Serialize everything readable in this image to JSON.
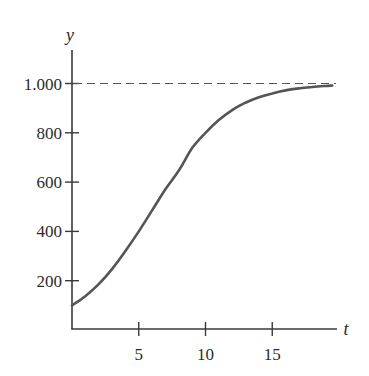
{
  "chart_data": {
    "type": "line",
    "title": "",
    "xlabel": "t",
    "ylabel": "y",
    "xlim": [
      0,
      20
    ],
    "ylim": [
      0,
      1000
    ],
    "x_ticks": [
      5,
      10,
      15
    ],
    "x_tick_labels": [
      "5",
      "10",
      "15"
    ],
    "y_ticks": [
      200,
      400,
      600,
      800,
      1000
    ],
    "y_tick_labels": [
      "200",
      "400",
      "600",
      "800",
      "1.000"
    ],
    "grid": false,
    "legend": null,
    "asymptote": {
      "y": 1000,
      "style": "dashed"
    },
    "series": [
      {
        "name": "logistic curve",
        "x": [
          0,
          1,
          2,
          3,
          4,
          5,
          6,
          7,
          8,
          9,
          10,
          11,
          12,
          13,
          14,
          15,
          16,
          17,
          18,
          19,
          19.5
        ],
        "values": [
          100,
          137,
          186,
          247,
          320,
          400,
          485,
          571,
          647,
          738,
          800,
          852,
          892,
          922,
          944,
          960,
          972,
          980,
          986,
          990,
          992
        ]
      }
    ],
    "colors": {
      "curve": "#555555",
      "axes": "#3a3a3a",
      "asymptote": "#555555"
    }
  }
}
